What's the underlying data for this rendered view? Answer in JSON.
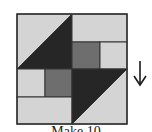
{
  "block": {
    "colors": {
      "light": "#d4d4d4",
      "medium": "#6e6e6e",
      "dark": "#262626",
      "line": "#333333"
    },
    "pieces": [
      {
        "name": "top-left-light-triangle",
        "shape": "polygon",
        "points": "17,14 72,14 17,69",
        "fill": "light"
      },
      {
        "name": "top-left-dark-triangle",
        "shape": "polygon",
        "points": "72,14 72,69 17,69",
        "fill": "dark"
      },
      {
        "name": "top-right-light-rect",
        "shape": "rect",
        "x": 72,
        "y": 14,
        "w": 55,
        "h": 28,
        "fill": "light"
      },
      {
        "name": "top-right-medium-square",
        "shape": "rect",
        "x": 72,
        "y": 42,
        "w": 28,
        "h": 27,
        "fill": "medium"
      },
      {
        "name": "top-right-light-small-rect",
        "shape": "rect",
        "x": 100,
        "y": 42,
        "w": 27,
        "h": 27,
        "fill": "light"
      },
      {
        "name": "bottom-left-light-small-rect",
        "shape": "rect",
        "x": 17,
        "y": 69,
        "w": 28,
        "h": 28,
        "fill": "light"
      },
      {
        "name": "bottom-left-medium-square",
        "shape": "rect",
        "x": 45,
        "y": 69,
        "w": 27,
        "h": 28,
        "fill": "medium"
      },
      {
        "name": "bottom-left-light-rect",
        "shape": "rect",
        "x": 17,
        "y": 97,
        "w": 55,
        "h": 27,
        "fill": "light"
      },
      {
        "name": "bottom-right-dark-triangle",
        "shape": "polygon",
        "points": "72,69 127,69 72,124",
        "fill": "dark"
      },
      {
        "name": "bottom-right-light-triangle",
        "shape": "polygon",
        "points": "127,69 127,124 72,124",
        "fill": "light"
      }
    ]
  },
  "arrow": {
    "direction": "down",
    "icon": "arrow-down-icon"
  },
  "caption": "Make 10"
}
